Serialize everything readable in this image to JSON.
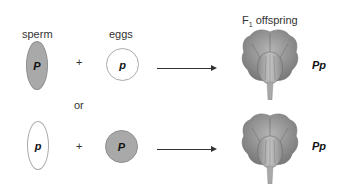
{
  "labels": {
    "sperm": "sperm",
    "eggs": "eggs",
    "offspring_prefix": "F",
    "offspring_sub": "1",
    "offspring_suffix": " offspring",
    "or": "or",
    "plus": "+"
  },
  "crosses": [
    {
      "sperm": {
        "allele": "P",
        "fill": "#a9a9a9",
        "shaded": true
      },
      "egg": {
        "allele": "p",
        "fill": "#ffffff",
        "shaded": false
      },
      "offspring_genotype": "Pp",
      "offspring_icon": "purple-flower-icon"
    },
    {
      "sperm": {
        "allele": "p",
        "fill": "#ffffff",
        "shaded": false
      },
      "egg": {
        "allele": "P",
        "fill": "#a9a9a9",
        "shaded": true
      },
      "offspring_genotype": "Pp",
      "offspring_icon": "purple-flower-icon"
    }
  ]
}
